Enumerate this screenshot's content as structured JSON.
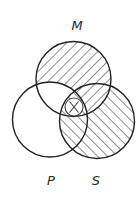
{
  "diagram": {
    "type": "venn",
    "circles": [
      {
        "id": "M",
        "label": "M",
        "cx": 73.5,
        "cy": 79,
        "r": 37.5,
        "label_x": 77,
        "label_y": 30
      },
      {
        "id": "P",
        "label": "P",
        "cx": 50,
        "cy": 119.5,
        "r": 37.5,
        "label_x": 51,
        "label_y": 185
      },
      {
        "id": "S",
        "label": "S",
        "cx": 97,
        "cy": 121,
        "r": 37.5,
        "label_x": 96,
        "label_y": 185
      }
    ],
    "shaded_regions": [
      {
        "region": "M only",
        "hatch": "forward-slash"
      },
      {
        "region": "M and S not P",
        "hatch": "forward-slash"
      },
      {
        "region": "S only",
        "hatch": "back-slash"
      },
      {
        "region": "P and S not M",
        "hatch": "back-slash"
      },
      {
        "region": "M and P and S",
        "hatch": "back-slash"
      }
    ],
    "unshaded_regions": [
      "P only",
      "M and P not S"
    ],
    "marker": {
      "symbol": "X",
      "region": "M and P and S",
      "cx": 74,
      "cy": 107,
      "r": 9
    },
    "colors": {
      "stroke": "#222222",
      "hatch": "#555555",
      "background": "#ffffff"
    }
  }
}
